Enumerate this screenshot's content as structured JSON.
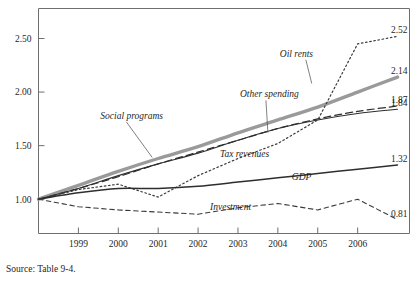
{
  "source_note": "Source: Table 9-4.",
  "chart_data": {
    "type": "line",
    "title": "",
    "xlabel": "",
    "ylabel": "",
    "grid": false,
    "legend_position": "inline-labels",
    "x": [
      1998,
      1999,
      2000,
      2001,
      2002,
      2003,
      2004,
      2005,
      2006,
      2007
    ],
    "xticks": [
      "1999",
      "2000",
      "2001",
      "2002",
      "2003",
      "2004",
      "2005",
      "2006"
    ],
    "xtick_values": [
      1999,
      2000,
      2001,
      2002,
      2003,
      2004,
      2005,
      2006
    ],
    "xlim": [
      1998,
      2007.3
    ],
    "yticks": [
      "1.00",
      "1.50",
      "2.00",
      "2.50"
    ],
    "ytick_values": [
      1.0,
      1.5,
      2.0,
      2.5
    ],
    "ylim": [
      0.68,
      2.78
    ],
    "series": [
      {
        "name": "Social programs",
        "style": "thick-gray",
        "color": "#9a9a9a",
        "width": 3.4,
        "dash": "none",
        "label": "Social programs",
        "label_x": 1999.55,
        "label_y": 1.75,
        "leader_to_x": 2000.85,
        "leader_to_y": 1.39,
        "end_value": "2.14",
        "values": [
          1.0,
          1.13,
          1.26,
          1.38,
          1.49,
          1.62,
          1.74,
          1.86,
          2.0,
          2.14
        ]
      },
      {
        "name": "Other spending",
        "style": "dashed",
        "color": "#2e2e2e",
        "width": 1.2,
        "dash": "7,4",
        "label": "Other spending",
        "label_x": 2003.05,
        "label_y": 1.95,
        "leader_to_x": 2003.75,
        "leader_to_y": 1.62,
        "end_value": "1.87",
        "values": [
          1.0,
          1.1,
          1.21,
          1.33,
          1.44,
          1.55,
          1.66,
          1.75,
          1.82,
          1.87
        ]
      },
      {
        "name": "Tax revenues",
        "style": "solid-thin",
        "color": "#2e2e2e",
        "width": 1.1,
        "dash": "none",
        "label": "Tax revenues",
        "label_x": 2002.55,
        "label_y": 1.39,
        "leader_to_x": 2002.55,
        "leader_to_y": 1.39,
        "end_value": "1.84",
        "values": [
          1.0,
          1.1,
          1.22,
          1.33,
          1.43,
          1.55,
          1.66,
          1.74,
          1.8,
          1.84
        ]
      },
      {
        "name": "Oil rents",
        "style": "dotted",
        "color": "#3a3a3a",
        "width": 1.2,
        "dash": "1.6,2.6",
        "label": "Oil rents",
        "label_x": 2004.05,
        "label_y": 2.33,
        "leader_to_x": 2004.85,
        "leader_to_y": 2.08,
        "end_value": "2.52",
        "values": [
          1.0,
          1.09,
          1.14,
          1.02,
          1.22,
          1.38,
          1.52,
          1.74,
          2.45,
          2.52
        ]
      },
      {
        "name": "GDP",
        "style": "solid-medium",
        "color": "#2e2e2e",
        "width": 1.5,
        "dash": "none",
        "label": "GDP",
        "label_x": 2004.35,
        "label_y": 1.18,
        "leader_to_x": 2004.35,
        "leader_to_y": 1.18,
        "end_value": "1.32",
        "values": [
          1.0,
          1.06,
          1.1,
          1.1,
          1.12,
          1.16,
          1.2,
          1.24,
          1.28,
          1.32
        ]
      },
      {
        "name": "Investment",
        "style": "dashed-thin",
        "color": "#3a3a3a",
        "width": 1.1,
        "dash": "4.5,3.5",
        "label": "Investment",
        "label_x": 2002.3,
        "label_y": 0.9,
        "leader_to_x": 2002.3,
        "leader_to_y": 0.9,
        "end_value": "0.81",
        "values": [
          1.0,
          0.93,
          0.9,
          0.88,
          0.86,
          0.92,
          0.96,
          0.9,
          1.0,
          0.81
        ]
      }
    ],
    "end_labels": [
      {
        "text": "2.52",
        "value": 2.52
      },
      {
        "text": "2.14",
        "value": 2.14
      },
      {
        "text": "1.87",
        "value": 1.87
      },
      {
        "text": "1.84",
        "value": 1.84
      },
      {
        "text": "1.32",
        "value": 1.32
      },
      {
        "text": "0.81",
        "value": 0.81
      }
    ]
  }
}
